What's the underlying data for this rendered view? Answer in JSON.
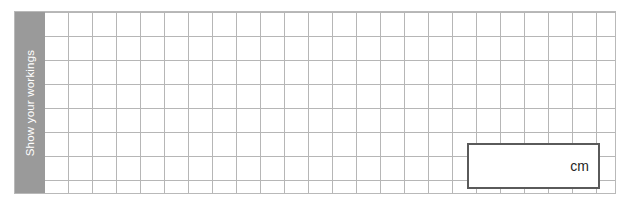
{
  "worksheet": {
    "working_area": {
      "label_band": {
        "text": "Show your workings",
        "background_color": "#9a9a9a",
        "text_color": "#ffffff"
      },
      "grid": {
        "cell_size_px": 24,
        "line_color": "#b6b6b6",
        "background_color": "#ffffff"
      },
      "frame_border_color": "#b9b9b9"
    },
    "answer_box": {
      "value": "",
      "placeholder": "",
      "unit_label": "cm",
      "border_color": "#5a5a5a",
      "background_color": "#ffffff"
    }
  }
}
